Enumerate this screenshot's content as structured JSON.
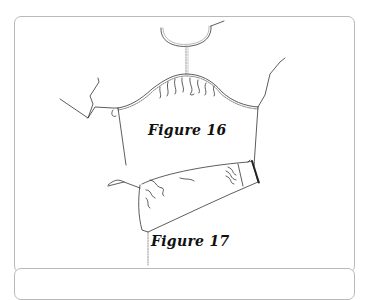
{
  "figures": [
    {
      "id": "fig16",
      "caption": "Figure 16",
      "description": "Gathered sleeve cap being set into bodice armhole"
    },
    {
      "id": "fig17",
      "caption": "Figure 17",
      "description": "Sleeve seam sewn with gathered cuff end"
    }
  ],
  "colors": {
    "line": "#333333",
    "stitch": "#888888",
    "border": "#b9b9b9"
  }
}
